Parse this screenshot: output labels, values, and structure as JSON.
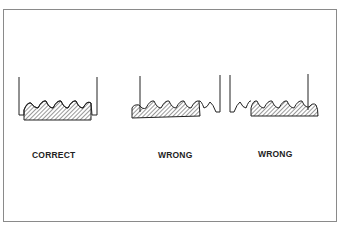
{
  "figure": {
    "panels": [
      {
        "label": "CORRECT",
        "description": "hatched part seated fully within both walls, threads aligned"
      },
      {
        "label": "WRONG",
        "description": "hatched part shifted left, protruding past left wall"
      },
      {
        "label": "WRONG",
        "description": "hatched part shifted right, protruding past right wall"
      }
    ],
    "colors": {
      "stroke": "#222222",
      "frame": "#8a8a8a",
      "background": "#ffffff"
    }
  }
}
